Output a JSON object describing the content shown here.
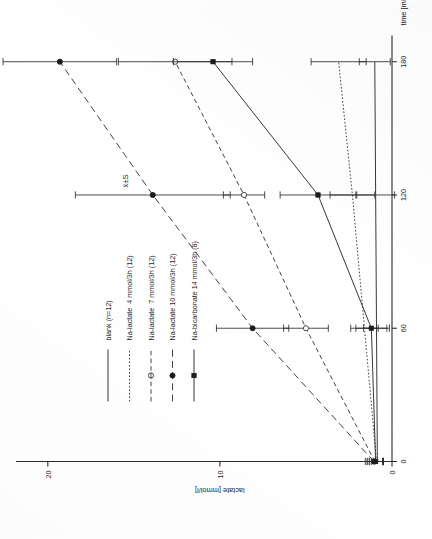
{
  "figure": {
    "annotation": "x̄±S"
  },
  "chart_data": {
    "type": "line",
    "title": "",
    "subtitle": "",
    "annotation": "x̄±S",
    "xlabel": "time [min]",
    "ylabel": "lactate [mmol/l]",
    "x": [
      0,
      60,
      120,
      180
    ],
    "xticks": [
      "0",
      "60",
      "120",
      "180"
    ],
    "xtickvalues": [
      0,
      60,
      120,
      180
    ],
    "yticks": [
      "0",
      "10",
      "20"
    ],
    "ytickvalues": [
      0,
      10,
      20
    ],
    "xlim": [
      0,
      190
    ],
    "ylim": [
      0,
      21.5
    ],
    "grid": false,
    "legend_position": "upper-left",
    "errorbars": "standard deviation",
    "series": [
      {
        "name": "blank (n=12)",
        "label": "blank (n=12)",
        "linestyle": "solid",
        "marker": "none",
        "values": [
          0.85,
          0.9,
          0.95,
          1.0
        ],
        "errors": [
          0.35,
          0.75,
          1.1,
          0.9
        ]
      },
      {
        "name": "Na-lactate  4 mmol/3h (12)",
        "label": "Na-lactate  4 mmol/3h (12)",
        "linestyle": "dotted",
        "marker": "none",
        "values": [
          0.9,
          1.6,
          2.3,
          3.1
        ],
        "errors": [
          0.4,
          0.8,
          1.3,
          1.6
        ]
      },
      {
        "name": "Na-lactate  7 mmol/3h (12)",
        "label": "Na-lactate  7 mmol/3h (12)",
        "linestyle": "dashed-short",
        "marker": "open-circle",
        "values": [
          1.0,
          5.0,
          8.6,
          12.6
        ],
        "errors": [
          0.45,
          1.3,
          1.2,
          3.3
        ]
      },
      {
        "name": "Na-lactate 10 mmol/3h (12)",
        "label": "Na-lactate 10 mmol/3h (12)",
        "linestyle": "dashed-long",
        "marker": "filled-circle",
        "values": [
          1.05,
          8.1,
          13.9,
          19.3
        ],
        "errors": [
          0.5,
          2.1,
          4.5,
          3.3
        ]
      },
      {
        "name": "Na-bicarbonate 14 mmol/3h (8)",
        "label": "Na-bicarbonate 14 mmol/3h (8)",
        "linestyle": "solid",
        "marker": "filled-square",
        "values": [
          0.95,
          1.2,
          4.3,
          10.4
        ],
        "errors": [
          0.45,
          0.9,
          2.2,
          2.3
        ]
      }
    ]
  }
}
